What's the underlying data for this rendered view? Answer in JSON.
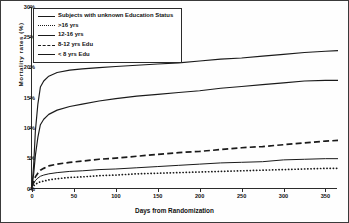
{
  "chart_data": {
    "type": "line",
    "title": "",
    "xlabel": "Days from Randomization",
    "ylabel": "Mortality rates (%)",
    "xlim": [
      0,
      365
    ],
    "ylim": [
      0,
      30
    ],
    "xticks": [
      "0",
      "50",
      "100",
      "150",
      "200",
      "250",
      "300",
      "350"
    ],
    "xtick_values": [
      0,
      50,
      100,
      150,
      200,
      250,
      300,
      350
    ],
    "yticks": [
      "0%",
      "5%",
      "10%",
      "15%",
      "20%",
      "25%",
      "30%"
    ],
    "ytick_values": [
      0,
      5,
      10,
      15,
      20,
      25,
      30
    ],
    "grid": false,
    "legend_position": "upper-left",
    "x": [
      0,
      2,
      4,
      7,
      10,
      14,
      20,
      30,
      45,
      60,
      80,
      100,
      125,
      150,
      175,
      200,
      225,
      250,
      275,
      300,
      325,
      350,
      365
    ],
    "series": [
      {
        "name": "Subjects with unknown Education Status",
        "style": "solid",
        "values": [
          0.4,
          4.0,
          9.5,
          14.0,
          16.8,
          17.8,
          18.6,
          19.2,
          19.6,
          19.8,
          20.0,
          20.2,
          20.4,
          20.6,
          20.8,
          21.1,
          21.4,
          21.6,
          21.9,
          22.2,
          22.5,
          22.7,
          22.8
        ]
      },
      {
        "name": ">16 yrs",
        "style": "dotted",
        "values": [
          0.2,
          0.5,
          0.8,
          1.0,
          1.2,
          1.3,
          1.5,
          1.7,
          1.9,
          2.0,
          2.2,
          2.3,
          2.5,
          2.6,
          2.7,
          2.8,
          2.9,
          3.0,
          3.1,
          3.2,
          3.3,
          3.4,
          3.4
        ]
      },
      {
        "name": "12-16 yrs",
        "style": "solid-thin",
        "values": [
          0.3,
          0.9,
          1.4,
          1.8,
          2.1,
          2.3,
          2.5,
          2.7,
          2.9,
          3.0,
          3.2,
          3.3,
          3.5,
          3.7,
          3.9,
          4.1,
          4.3,
          4.4,
          4.5,
          4.8,
          4.9,
          5.0,
          5.0
        ]
      },
      {
        "name": "8-12 yrs Edu",
        "style": "dashed",
        "values": [
          0.4,
          1.2,
          2.0,
          2.6,
          3.1,
          3.4,
          3.8,
          4.1,
          4.4,
          4.6,
          4.9,
          5.1,
          5.4,
          5.7,
          6.0,
          6.2,
          6.5,
          6.8,
          7.0,
          7.3,
          7.6,
          7.9,
          8.0
        ]
      },
      {
        "name": "< 8 yrs Edu",
        "style": "solid",
        "values": [
          0.5,
          2.5,
          5.5,
          8.5,
          10.6,
          11.5,
          12.3,
          13.0,
          13.6,
          14.0,
          14.5,
          14.9,
          15.3,
          15.6,
          15.9,
          16.2,
          16.6,
          16.9,
          17.2,
          17.5,
          17.8,
          17.9,
          17.9
        ]
      }
    ]
  },
  "legend": {
    "items": [
      {
        "label": "Subjects with unknown Education Status",
        "style": "solid"
      },
      {
        "label": ">16 yrs",
        "style": "dotted"
      },
      {
        "label": "12-16 yrs",
        "style": "solid-thin"
      },
      {
        "label": "8-12 yrs Edu",
        "style": "dashed"
      },
      {
        "label": "< 8 yrs Edu",
        "style": "solid"
      }
    ]
  }
}
